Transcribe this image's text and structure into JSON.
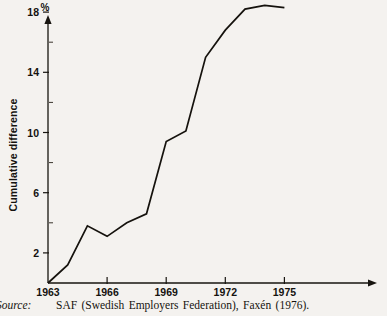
{
  "figure": {
    "unit_label": "%",
    "y_axis_title": "Cumulative difference",
    "background_color": "#f4f2ef",
    "line_color": "#15120d",
    "axis_color": "#17140f"
  },
  "source": {
    "label": "Source:",
    "text": "SAF (Swedish Employers Federation), Faxén (1976)."
  },
  "chart_data": {
    "type": "line",
    "title": "",
    "subtitle": "",
    "xlabel": "",
    "ylabel": "Cumulative difference",
    "unit": "%",
    "grid": false,
    "legend": "none",
    "xlim": [
      1963,
      1975.6
    ],
    "ylim": [
      0,
      19.6
    ],
    "x_ticks": [
      1963,
      1966,
      1969,
      1972,
      1975
    ],
    "x_tick_labels": [
      "1963",
      "1966",
      "1969",
      "1972",
      "1975"
    ],
    "y_ticks": [
      2,
      6,
      10,
      14,
      18
    ],
    "y_tick_labels": [
      "2",
      "6",
      "10",
      "14",
      "18"
    ],
    "y_minor_ticks": [
      4,
      8,
      12,
      16
    ],
    "series": [
      {
        "name": "Cumulative difference",
        "x": [
          1963,
          1964,
          1965,
          1966,
          1967,
          1968,
          1969,
          1970,
          1971,
          1972,
          1973,
          1974,
          1975
        ],
        "values": [
          0.0,
          1.2,
          3.8,
          3.1,
          4.0,
          4.6,
          9.4,
          10.1,
          15.0,
          16.8,
          18.2,
          18.45,
          18.3
        ]
      }
    ]
  }
}
